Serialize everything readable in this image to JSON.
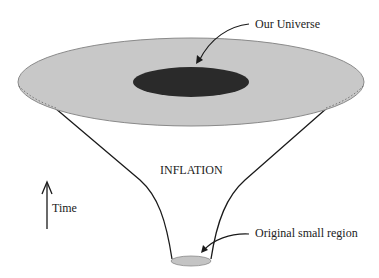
{
  "diagram": {
    "type": "cosmic-inflation-funnel",
    "labels": {
      "our_universe": "Our Universe",
      "inflation": "INFLATION",
      "time": "Time",
      "original_region": "Original small region"
    },
    "colors": {
      "outer_disk": "#c8c8c8",
      "outer_disk_edge": "#8a8a8a",
      "our_universe_fill": "#2a2a2a",
      "small_region_fill": "#c4c4c4",
      "line": "#1a1a1a",
      "background": "#ffffff"
    }
  }
}
